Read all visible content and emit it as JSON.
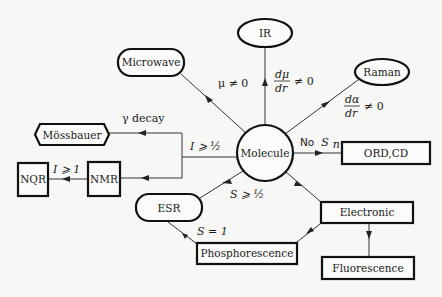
{
  "diagram": {
    "center": "Molecule",
    "nodes": {
      "microwave": "Microwave",
      "ir": "IR",
      "raman": "Raman",
      "mossbauer": "Mössbauer",
      "nqr": "NQR",
      "nmr": "NMR",
      "molecule": "Molecule",
      "ord_cd": "ORD,CD",
      "esr": "ESR",
      "electronic": "Electronic",
      "phosphorescence": "Phosphorescence",
      "fluorescence": "Fluorescence"
    },
    "edge_labels": {
      "microwave": "μ ≠ 0",
      "ir_num": "dμ",
      "ir_den": "dr",
      "ir_rel": "≠ 0",
      "raman_num": "dα",
      "raman_den": "dr",
      "raman_rel": "≠ 0",
      "mossbauer": "γ decay",
      "nmr": "I ⩾ ½",
      "nqr": "I ⩾ 1",
      "ord_cd_prefix": "No",
      "ord_cd_sym": "S",
      "ord_cd_sub": "n",
      "esr": "S ⩾ ½",
      "phos_esr": "S = 1"
    }
  }
}
